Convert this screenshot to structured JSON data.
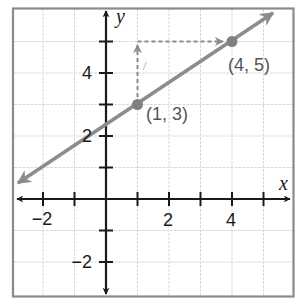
{
  "graph": {
    "x_axis_label": "x",
    "y_axis_label": "y",
    "x_tick_labels": [
      {
        "value": -2,
        "text": "−2"
      },
      {
        "value": 2,
        "text": "2"
      },
      {
        "value": 4,
        "text": "4"
      }
    ],
    "y_tick_labels": [
      {
        "value": 4,
        "text": "4"
      },
      {
        "value": 2,
        "text": "2"
      },
      {
        "value": -2,
        "text": "−2"
      }
    ],
    "points": [
      {
        "x": 1,
        "y": 3,
        "label": "(1, 3)"
      },
      {
        "x": 4,
        "y": 5,
        "label": "(4, 5)"
      }
    ],
    "line": {
      "slope": "2/3",
      "y_intercept": "7/3",
      "description": "line through (1, 3) and (4, 5)"
    },
    "rise_run_indicator": {
      "rise": 2,
      "run": 3,
      "description": "dashed arrow up from (1,3) to (1,5), then right to (4,5)"
    },
    "colors": {
      "grid": "#d9d9d9",
      "frame": "#8a8a8a",
      "axes": "#1a1a1a",
      "line": "#8c8c8c",
      "points": "#808080",
      "dashed": "#8c8c8c",
      "label_text": "#555555"
    },
    "xlim": [
      -3,
      6
    ],
    "ylim": [
      -3,
      6
    ]
  }
}
